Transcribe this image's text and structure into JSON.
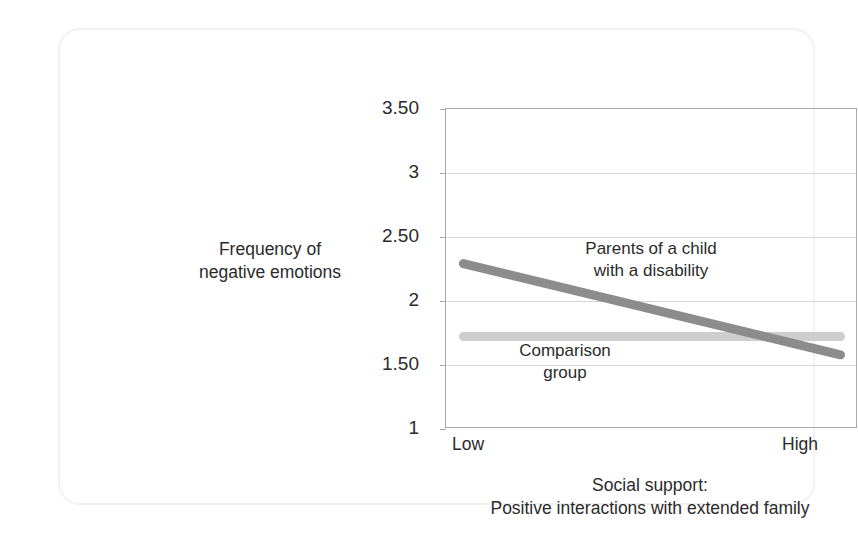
{
  "figure": {
    "source_credit": "Data from Ha, Greenberg, & Seltzer (2011)"
  },
  "chart_data": {
    "type": "line",
    "title": "",
    "xlabel_line1": "Social support:",
    "xlabel_line2": "Positive interactions with extended family",
    "ylabel_line1": "Frequency of",
    "ylabel_line2": "negative emotions",
    "x": [
      "Low",
      "High"
    ],
    "xtick_labels": [
      "Low",
      "High"
    ],
    "ytick_labels": [
      "3.50",
      "3",
      "2.50",
      "2",
      "1.50",
      "1"
    ],
    "ytick_values": [
      3.5,
      3,
      2.5,
      2,
      1.5,
      1
    ],
    "ylim": [
      1,
      3.5
    ],
    "grid": true,
    "legend_position": "in-plot annotations",
    "series": [
      {
        "name": "Parents of a child with a disability",
        "label_line1": "Parents of a child",
        "label_line2": "with a disability",
        "color": "#8c8c8c",
        "values": [
          2.3,
          1.57
        ]
      },
      {
        "name": "Comparison group",
        "label_line1": "Comparison",
        "label_line2": "group",
        "color": "#cecece",
        "values": [
          1.72,
          1.72
        ]
      }
    ]
  }
}
